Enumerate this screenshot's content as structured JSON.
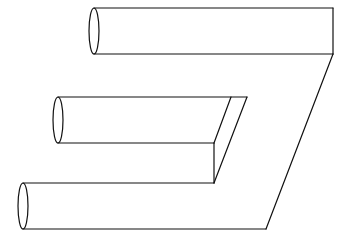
{
  "figure": {
    "stroke_color": "#111111",
    "background": "#ffffff",
    "prongs": [
      {
        "name": "top",
        "left_x": 94,
        "top_y": 8,
        "bottom_y": 54,
        "right_x": 333
      },
      {
        "name": "middle",
        "left_x": 58,
        "top_y": 97,
        "bottom_y": 143,
        "right_x": 247
      },
      {
        "name": "bottom",
        "left_x": 23,
        "top_y": 183,
        "bottom_y": 229,
        "right_x": 266
      }
    ]
  }
}
